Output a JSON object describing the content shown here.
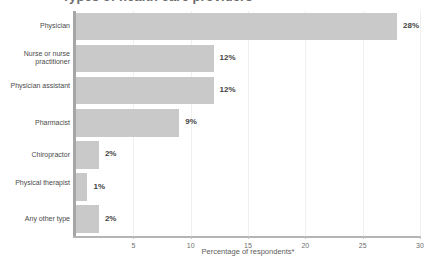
{
  "chart_data": {
    "type": "bar",
    "orientation": "horizontal",
    "title": "Types of health care providers",
    "xlabel": "Percentage of respondents*",
    "ylabel": "",
    "xlim": [
      0,
      30
    ],
    "xticks": [
      5,
      10,
      15,
      20,
      25,
      30
    ],
    "grid": true,
    "grid_axis": "x",
    "legend": null,
    "categories": [
      "Physician",
      "Nurse or nurse practitioner",
      "Physician assistant",
      "Pharmacist",
      "Chiropractor",
      "Physical therapist",
      "Any other type"
    ],
    "values": [
      28,
      12,
      12,
      9,
      2,
      1,
      2
    ],
    "value_labels": [
      "28%",
      "12%",
      "12%",
      "9%",
      "2%",
      "1%",
      "2%"
    ],
    "bar_color": "#c9c9c9",
    "axis_color": "#a6a6a6",
    "background": "#ffffff"
  },
  "axis": {
    "x_title": "Percentage of respondents*",
    "tick_labels": [
      "5",
      "10",
      "15",
      "20",
      "25",
      "30"
    ]
  },
  "title": {
    "text": "Types of health care providers"
  }
}
